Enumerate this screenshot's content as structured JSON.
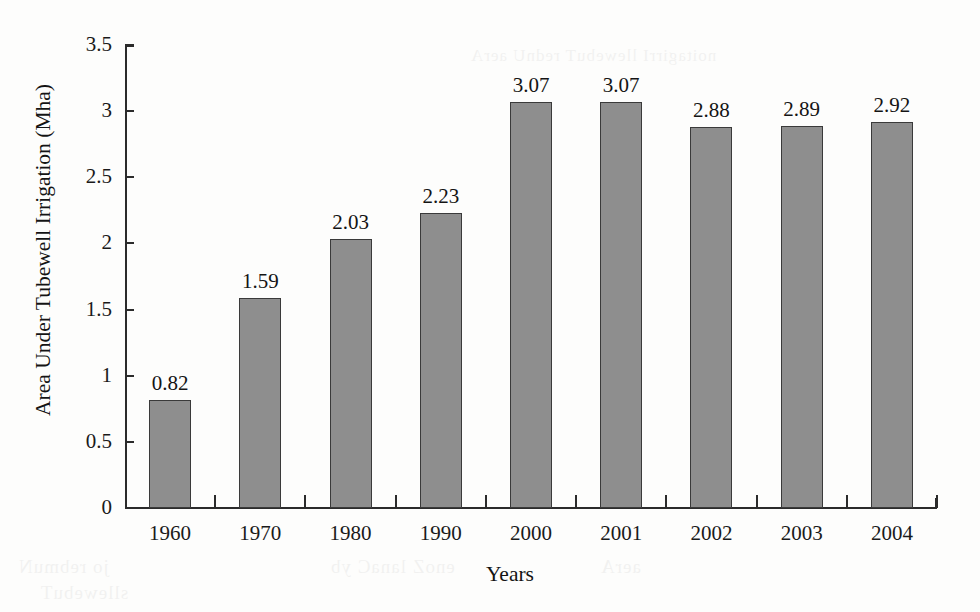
{
  "chart_data": {
    "type": "bar",
    "title": "",
    "xlabel": "Years",
    "ylabel": "Area Under Tubewell Irrigation (Mha)",
    "categories": [
      "1960",
      "1970",
      "1980",
      "1990",
      "2000",
      "2001",
      "2002",
      "2003",
      "2004"
    ],
    "values": [
      0.82,
      1.59,
      2.03,
      2.23,
      3.07,
      3.07,
      2.88,
      2.89,
      2.92
    ],
    "value_labels": [
      "0.82",
      "1.59",
      "2.03",
      "2.23",
      "3.07",
      "3.07",
      "2.88",
      "2.89",
      "2.92"
    ],
    "ylim": [
      0,
      3.5
    ],
    "ytick_values": [
      0,
      0.5,
      1,
      1.5,
      2,
      2.5,
      3,
      3.5
    ],
    "ytick_labels": [
      "0",
      "0.5",
      "1",
      "1.5",
      "2",
      "2.5",
      "3",
      "3.5"
    ],
    "grid": false,
    "legend": null,
    "bar_color": "#8e8e8e",
    "bar_edge_color": "#3a3a3a",
    "axis_color": "#2b2b2b"
  },
  "page": {
    "background": "#fdfdfc",
    "bleed_through": [
      "jo rebmuN",
      "enoZ lanaC yb",
      "aerA",
      "sllewebuT",
      "noitagirrI llewebuT rednU aerA"
    ]
  }
}
